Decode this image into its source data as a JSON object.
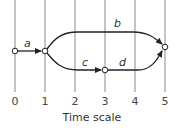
{
  "diagram": {
    "type": "activity-network-on-time-scale",
    "axis_title": "Time scale",
    "ticks": [
      "0",
      "1",
      "2",
      "3",
      "4",
      "5"
    ],
    "nodes": [
      {
        "id": "n0",
        "time": 0
      },
      {
        "id": "n1",
        "time": 1
      },
      {
        "id": "n3",
        "time": 3
      },
      {
        "id": "n5",
        "time": 5
      }
    ],
    "activities": [
      {
        "label": "a",
        "from": "n0",
        "to": "n1"
      },
      {
        "label": "b",
        "from": "n1",
        "to": "n5"
      },
      {
        "label": "c",
        "from": "n1",
        "to": "n3"
      },
      {
        "label": "d",
        "from": "n3",
        "to": "n5"
      }
    ],
    "colors": {
      "line": "#222222",
      "grid": "#8a8a8a",
      "node_fill": "#ffffff"
    }
  }
}
